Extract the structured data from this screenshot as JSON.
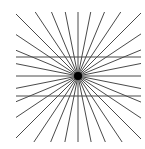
{
  "figure": {
    "panel_label": ")",
    "line_color": "#4a4a4a",
    "dot_color": "#000000",
    "background": "#ffffff",
    "center": {
      "x": 78,
      "y": 76
    },
    "clip_box": {
      "x": 16,
      "y": 12,
      "width": 125,
      "height": 130
    },
    "radial_line_count": 16,
    "radial_angle_step_deg": 11.25,
    "radial_line_width": 1,
    "horizontal_lines": [
      {
        "y": 57,
        "x1": 16,
        "x2": 141
      },
      {
        "y": 96,
        "x1": 16,
        "x2": 141
      }
    ],
    "horizontal_line_width": 1.2,
    "center_dot_radius": 4
  }
}
